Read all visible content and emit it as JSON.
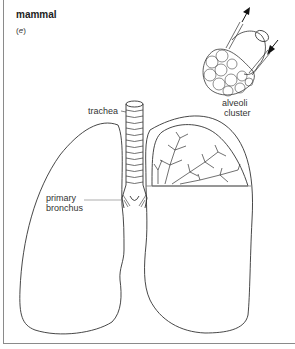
{
  "figure": {
    "title": "mammal",
    "panel_label_open": "(",
    "panel_label": "e",
    "panel_label_close": ")"
  },
  "labels": {
    "alveoli_line1": "alveoli",
    "alveoli_line2": "cluster",
    "trachea": "trachea",
    "bronchus_line1": "primary",
    "bronchus_line2": "bronchus"
  },
  "colors": {
    "line": "#333333",
    "frame": "#8a8a8a"
  }
}
